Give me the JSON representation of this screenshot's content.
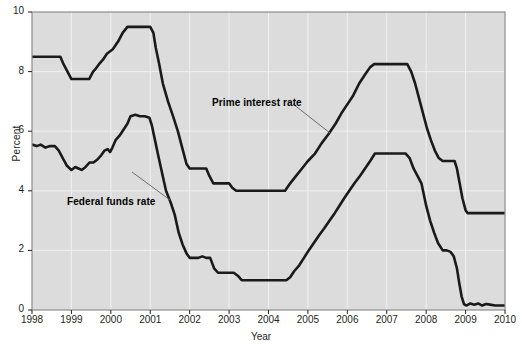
{
  "chart_data": {
    "type": "line",
    "title": "",
    "xlabel": "Year",
    "ylabel": "Percent",
    "xlim": [
      1998,
      2010
    ],
    "ylim": [
      0,
      10
    ],
    "yticks": [
      0,
      2,
      4,
      6,
      8,
      10
    ],
    "xticks": [
      1998,
      1999,
      2000,
      2001,
      2002,
      2003,
      2004,
      2005,
      2006,
      2007,
      2008,
      2009,
      2010
    ],
    "grid": true,
    "legend_position": "annotations-on-plot",
    "plot_background": "#dcdcdc",
    "line_color": "#1a1a1a",
    "annotations": [
      {
        "text": "Prime interest rate",
        "x": 2002.55,
        "y": 7.05
      },
      {
        "text": "Federal funds rate",
        "x": 1999.05,
        "y": 3.85
      }
    ],
    "series": [
      {
        "name": "Prime interest rate",
        "points": [
          [
            1998.0,
            8.5
          ],
          [
            1998.72,
            8.5
          ],
          [
            1998.8,
            8.25
          ],
          [
            1998.9,
            8.0
          ],
          [
            1999.0,
            7.75
          ],
          [
            1999.45,
            7.75
          ],
          [
            1999.55,
            8.0
          ],
          [
            1999.62,
            8.1
          ],
          [
            1999.7,
            8.25
          ],
          [
            1999.8,
            8.4
          ],
          [
            1999.9,
            8.6
          ],
          [
            2000.05,
            8.75
          ],
          [
            2000.18,
            9.0
          ],
          [
            2000.3,
            9.3
          ],
          [
            2000.42,
            9.5
          ],
          [
            2001.0,
            9.5
          ],
          [
            2001.08,
            9.3
          ],
          [
            2001.14,
            8.8
          ],
          [
            2001.22,
            8.3
          ],
          [
            2001.32,
            7.6
          ],
          [
            2001.45,
            7.0
          ],
          [
            2001.58,
            6.5
          ],
          [
            2001.7,
            6.0
          ],
          [
            2001.8,
            5.5
          ],
          [
            2001.92,
            4.9
          ],
          [
            2002.0,
            4.75
          ],
          [
            2002.42,
            4.75
          ],
          [
            2002.5,
            4.5
          ],
          [
            2002.6,
            4.25
          ],
          [
            2003.0,
            4.25
          ],
          [
            2003.08,
            4.1
          ],
          [
            2003.18,
            4.0
          ],
          [
            2004.42,
            4.0
          ],
          [
            2004.55,
            4.25
          ],
          [
            2004.7,
            4.5
          ],
          [
            2004.85,
            4.75
          ],
          [
            2005.0,
            5.0
          ],
          [
            2005.18,
            5.25
          ],
          [
            2005.35,
            5.6
          ],
          [
            2005.52,
            5.9
          ],
          [
            2005.7,
            6.25
          ],
          [
            2005.85,
            6.6
          ],
          [
            2006.0,
            6.9
          ],
          [
            2006.15,
            7.2
          ],
          [
            2006.3,
            7.6
          ],
          [
            2006.45,
            7.9
          ],
          [
            2006.58,
            8.15
          ],
          [
            2006.68,
            8.25
          ],
          [
            2007.52,
            8.25
          ],
          [
            2007.62,
            8.0
          ],
          [
            2007.72,
            7.6
          ],
          [
            2007.82,
            7.1
          ],
          [
            2007.92,
            6.6
          ],
          [
            2008.02,
            6.1
          ],
          [
            2008.12,
            5.7
          ],
          [
            2008.22,
            5.35
          ],
          [
            2008.32,
            5.1
          ],
          [
            2008.42,
            5.0
          ],
          [
            2008.72,
            5.0
          ],
          [
            2008.78,
            4.75
          ],
          [
            2008.85,
            4.25
          ],
          [
            2008.92,
            3.75
          ],
          [
            2009.0,
            3.35
          ],
          [
            2009.05,
            3.25
          ],
          [
            2010.0,
            3.25
          ]
        ]
      },
      {
        "name": "Federal funds rate",
        "points": [
          [
            1998.0,
            5.55
          ],
          [
            1998.12,
            5.5
          ],
          [
            1998.22,
            5.55
          ],
          [
            1998.34,
            5.45
          ],
          [
            1998.46,
            5.5
          ],
          [
            1998.58,
            5.5
          ],
          [
            1998.68,
            5.35
          ],
          [
            1998.78,
            5.1
          ],
          [
            1998.88,
            4.85
          ],
          [
            1999.0,
            4.7
          ],
          [
            1999.1,
            4.8
          ],
          [
            1999.18,
            4.75
          ],
          [
            1999.26,
            4.7
          ],
          [
            1999.36,
            4.8
          ],
          [
            1999.46,
            4.95
          ],
          [
            1999.56,
            4.95
          ],
          [
            1999.66,
            5.05
          ],
          [
            1999.76,
            5.2
          ],
          [
            1999.84,
            5.35
          ],
          [
            1999.92,
            5.4
          ],
          [
            1999.98,
            5.3
          ],
          [
            2000.04,
            5.45
          ],
          [
            2000.12,
            5.7
          ],
          [
            2000.22,
            5.85
          ],
          [
            2000.32,
            6.05
          ],
          [
            2000.42,
            6.25
          ],
          [
            2000.5,
            6.5
          ],
          [
            2000.62,
            6.55
          ],
          [
            2000.74,
            6.5
          ],
          [
            2000.86,
            6.5
          ],
          [
            2000.98,
            6.45
          ],
          [
            2001.04,
            6.2
          ],
          [
            2001.12,
            5.7
          ],
          [
            2001.2,
            5.2
          ],
          [
            2001.3,
            4.6
          ],
          [
            2001.4,
            4.0
          ],
          [
            2001.52,
            3.6
          ],
          [
            2001.62,
            3.2
          ],
          [
            2001.72,
            2.6
          ],
          [
            2001.82,
            2.2
          ],
          [
            2001.92,
            1.9
          ],
          [
            2002.0,
            1.75
          ],
          [
            2002.22,
            1.75
          ],
          [
            2002.32,
            1.8
          ],
          [
            2002.42,
            1.75
          ],
          [
            2002.52,
            1.75
          ],
          [
            2002.62,
            1.4
          ],
          [
            2002.72,
            1.25
          ],
          [
            2003.0,
            1.25
          ],
          [
            2003.12,
            1.25
          ],
          [
            2003.22,
            1.15
          ],
          [
            2003.32,
            1.0
          ],
          [
            2004.45,
            1.0
          ],
          [
            2004.55,
            1.1
          ],
          [
            2004.65,
            1.3
          ],
          [
            2004.78,
            1.5
          ],
          [
            2004.9,
            1.75
          ],
          [
            2005.02,
            2.0
          ],
          [
            2005.15,
            2.25
          ],
          [
            2005.28,
            2.5
          ],
          [
            2005.42,
            2.75
          ],
          [
            2005.55,
            3.0
          ],
          [
            2005.68,
            3.25
          ],
          [
            2005.8,
            3.5
          ],
          [
            2005.92,
            3.75
          ],
          [
            2006.05,
            4.0
          ],
          [
            2006.18,
            4.25
          ],
          [
            2006.32,
            4.5
          ],
          [
            2006.45,
            4.75
          ],
          [
            2006.58,
            5.0
          ],
          [
            2006.7,
            5.25
          ],
          [
            2007.48,
            5.25
          ],
          [
            2007.58,
            5.1
          ],
          [
            2007.68,
            4.75
          ],
          [
            2007.78,
            4.5
          ],
          [
            2007.88,
            4.25
          ],
          [
            2008.0,
            3.5
          ],
          [
            2008.1,
            3.0
          ],
          [
            2008.2,
            2.6
          ],
          [
            2008.3,
            2.25
          ],
          [
            2008.42,
            2.0
          ],
          [
            2008.52,
            2.0
          ],
          [
            2008.62,
            1.95
          ],
          [
            2008.7,
            1.8
          ],
          [
            2008.78,
            1.4
          ],
          [
            2008.84,
            0.9
          ],
          [
            2008.9,
            0.45
          ],
          [
            2008.96,
            0.2
          ],
          [
            2009.02,
            0.15
          ],
          [
            2009.12,
            0.22
          ],
          [
            2009.22,
            0.18
          ],
          [
            2009.32,
            0.22
          ],
          [
            2009.42,
            0.15
          ],
          [
            2009.52,
            0.2
          ],
          [
            2009.62,
            0.18
          ],
          [
            2009.75,
            0.15
          ],
          [
            2009.88,
            0.15
          ],
          [
            2010.0,
            0.15
          ]
        ]
      }
    ]
  },
  "axis": {
    "ylabel": "Percent",
    "xlabel": "Year",
    "ytick_labels": [
      "0",
      "2",
      "4",
      "6",
      "8",
      "10"
    ],
    "xtick_labels": [
      "1998",
      "1999",
      "2000",
      "2001",
      "2002",
      "2003",
      "2004",
      "2005",
      "2006",
      "2007",
      "2008",
      "2009",
      "2010"
    ]
  },
  "annotations": {
    "prime": "Prime interest rate",
    "fedfunds": "Federal funds rate"
  }
}
